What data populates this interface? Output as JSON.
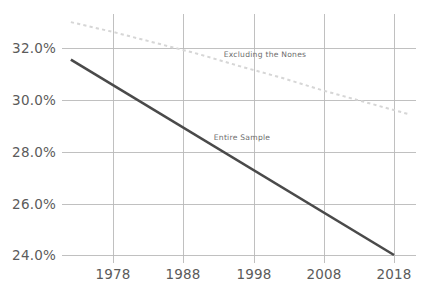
{
  "chart_data": {
    "type": "line",
    "title": "",
    "subtitle": "",
    "xlabel": "",
    "ylabel": "",
    "xlim": [
      1972,
      2020
    ],
    "ylim": [
      23.2,
      33.6
    ],
    "grid": true,
    "grid_axes": "both",
    "legend_position": "inline-annotations",
    "x_ticks": [
      1978,
      1988,
      1998,
      2008,
      2018
    ],
    "x_tick_labels": [
      "1978",
      "1988",
      "1998",
      "2008",
      "2018"
    ],
    "y_ticks": [
      24.0,
      26.0,
      28.0,
      30.0,
      32.0
    ],
    "y_tick_labels": [
      "24.0%",
      "26.0%",
      "28.0%",
      "30.0%",
      "32.0%"
    ],
    "series": [
      {
        "name": "Entire Sample",
        "label": "Entire Sample",
        "style": "solid",
        "color": "#4a4a4a",
        "label_x": 1992.5,
        "label_y": 28.55,
        "x": [
          1972,
          2018
        ],
        "values": [
          31.55,
          24.0
        ]
      },
      {
        "name": "Excluding the Nones",
        "label": "Excluding the Nones",
        "style": "dotted",
        "color": "#d6d6d6",
        "label_x": 2001.0,
        "label_y": 31.25,
        "x": [
          1972,
          1978,
          1984,
          1990,
          1996,
          2002,
          2008,
          2014,
          2020
        ],
        "values": [
          33.0,
          32.62,
          32.2,
          31.78,
          31.3,
          30.85,
          30.35,
          29.9,
          29.45
        ]
      }
    ]
  },
  "axis": {
    "y_labels": [
      "32.0%",
      "30.0%",
      "28.0%",
      "26.0%",
      "24.0%"
    ],
    "x_labels": [
      "1978",
      "1988",
      "1998",
      "2008",
      "2018"
    ]
  },
  "annotations": {
    "excluding_nones": "Excluding the Nones",
    "entire_sample": "Entire Sample"
  },
  "colors": {
    "solid_series": "#4a4a4a",
    "dotted_series": "#d6d6d6",
    "gridline": "#b9b9b9",
    "tick_text": "#5b5b5b",
    "annotation_text": "#6d6d6d",
    "background": "#ffffff"
  }
}
